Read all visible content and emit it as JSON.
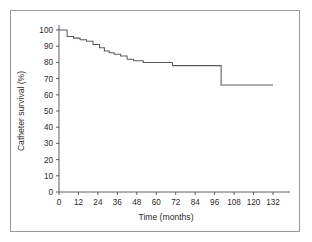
{
  "figure": {
    "background_color": "#ffffff",
    "frame_color": "#9a9a9a",
    "line_color": "#5a5a5a",
    "axis_color": "#4d4d4d",
    "text_color": "#2b2b2b"
  },
  "chart_data": {
    "type": "line",
    "subtype": "kaplan-meier-step",
    "title": "",
    "xlabel": "Time (months)",
    "ylabel": "Catheter survival (%)",
    "xlim": [
      0,
      138
    ],
    "ylim": [
      0,
      103
    ],
    "xticks": [
      0,
      12,
      24,
      36,
      48,
      60,
      72,
      84,
      96,
      108,
      120,
      132
    ],
    "xtick_labels": [
      "0",
      "12",
      "24",
      "36",
      "48",
      "60",
      "72",
      "84",
      "96",
      "108",
      "120",
      "132"
    ],
    "yticks": [
      0,
      10,
      20,
      30,
      40,
      50,
      60,
      70,
      80,
      90,
      100
    ],
    "ytick_labels": [
      "0",
      "10",
      "20",
      "30",
      "40",
      "50",
      "60",
      "70",
      "80",
      "90",
      "100"
    ],
    "grid": false,
    "legend": null,
    "legend_position": "none",
    "series": [
      {
        "name": "Catheter survival",
        "step": "post",
        "x": [
          0,
          5,
          9,
          13,
          17,
          21,
          25,
          28,
          31,
          34,
          38,
          42,
          46,
          49,
          52,
          56,
          70,
          100,
          132
        ],
        "y": [
          100,
          100,
          96,
          95,
          94,
          93,
          91,
          89,
          87,
          86,
          85,
          84,
          82,
          81,
          81,
          80,
          80,
          78,
          66
        ],
        "points": [
          {
            "time": 0,
            "survival": 100
          },
          {
            "time": 5,
            "survival": 100
          },
          {
            "time": 5,
            "survival": 96
          },
          {
            "time": 9,
            "survival": 96
          },
          {
            "time": 9,
            "survival": 95
          },
          {
            "time": 13,
            "survival": 95
          },
          {
            "time": 13,
            "survival": 94
          },
          {
            "time": 17,
            "survival": 94
          },
          {
            "time": 17,
            "survival": 93
          },
          {
            "time": 21,
            "survival": 93
          },
          {
            "time": 21,
            "survival": 91
          },
          {
            "time": 25,
            "survival": 91
          },
          {
            "time": 25,
            "survival": 89
          },
          {
            "time": 28,
            "survival": 89
          },
          {
            "time": 28,
            "survival": 87
          },
          {
            "time": 31,
            "survival": 87
          },
          {
            "time": 31,
            "survival": 86
          },
          {
            "time": 34,
            "survival": 86
          },
          {
            "time": 34,
            "survival": 85
          },
          {
            "time": 38,
            "survival": 85
          },
          {
            "time": 38,
            "survival": 84
          },
          {
            "time": 42,
            "survival": 84
          },
          {
            "time": 42,
            "survival": 82
          },
          {
            "time": 46,
            "survival": 82
          },
          {
            "time": 46,
            "survival": 81
          },
          {
            "time": 52,
            "survival": 81
          },
          {
            "time": 52,
            "survival": 80
          },
          {
            "time": 70,
            "survival": 80
          },
          {
            "time": 70,
            "survival": 78
          },
          {
            "time": 100,
            "survival": 78
          },
          {
            "time": 100,
            "survival": 66
          },
          {
            "time": 132,
            "survival": 66
          }
        ]
      }
    ]
  }
}
